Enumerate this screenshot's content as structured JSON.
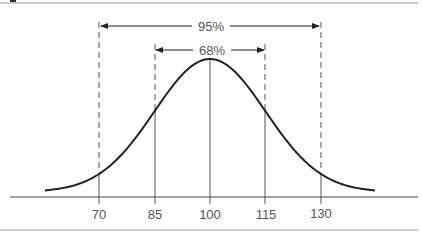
{
  "chart_data": {
    "type": "line",
    "xlabel": "",
    "ylabel": "",
    "x_ticks": [
      70,
      85,
      100,
      115,
      130
    ],
    "tick_labels": [
      "70",
      "85",
      "100",
      "115",
      "130"
    ],
    "mean": 100,
    "sd": 15,
    "annotations": [
      {
        "label": "95%",
        "from": 70,
        "to": 130
      },
      {
        "label": "68%",
        "from": 85,
        "to": 115
      }
    ],
    "grid": false
  },
  "labels": {
    "band95": "95%",
    "band68": "68%",
    "t70": "70",
    "t85": "85",
    "t100": "100",
    "t115": "115",
    "t130": "130"
  }
}
